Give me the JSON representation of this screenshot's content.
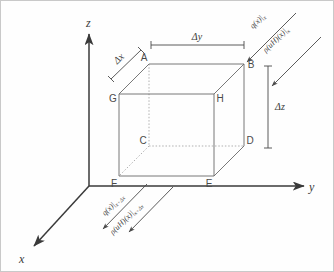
{
  "diagram": {
    "background_color": "#fefefe",
    "border_color": "#c9c9c9",
    "line_color": "#5a5a5a",
    "hidden_line_color": "#9a9a9a",
    "axes": {
      "x_label": "x",
      "y_label": "y",
      "z_label": "z"
    },
    "vertices": {
      "A": "A",
      "B": "B",
      "C": "C",
      "D": "D",
      "E": "E",
      "F": "F",
      "G": "G",
      "H": "H"
    },
    "dimensions": {
      "dx": "Δx",
      "dy": "Δy",
      "dz": "Δz"
    },
    "fluxes": {
      "in_heat_main": "q(x)|",
      "in_heat_sub": "x",
      "in_enthalpy_main": "ρ(uH)(x)|",
      "in_enthalpy_sub": "x",
      "out_heat_main": "q(x)|",
      "out_heat_sub": "x+Δx",
      "out_enthalpy_main": "ρ(uH)(x)|",
      "out_enthalpy_sub": "x+Δx"
    }
  }
}
